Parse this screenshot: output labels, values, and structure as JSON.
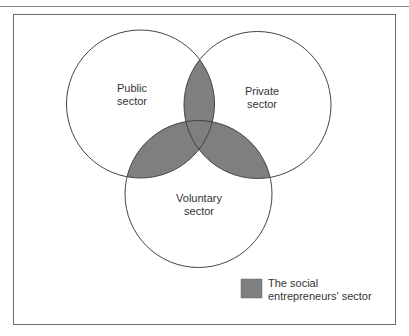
{
  "diagram": {
    "sets": [
      {
        "id": "public",
        "label_lines": [
          "Public",
          "sector"
        ]
      },
      {
        "id": "private",
        "label_lines": [
          "Private",
          "sector"
        ]
      },
      {
        "id": "voluntary",
        "label_lines": [
          "Voluntary",
          "sector"
        ]
      }
    ],
    "shaded_regions": [
      "public∩private",
      "public∩voluntary",
      "private∩voluntary",
      "public∩private∩voluntary"
    ],
    "legend": {
      "label_lines": [
        "The social",
        "entrepreneurs' sector"
      ]
    },
    "colors": {
      "shaded_fill": "#7f7f7f",
      "circle_stroke": "#444444",
      "frame_border": "#6a6a6a",
      "text": "#333333"
    }
  }
}
